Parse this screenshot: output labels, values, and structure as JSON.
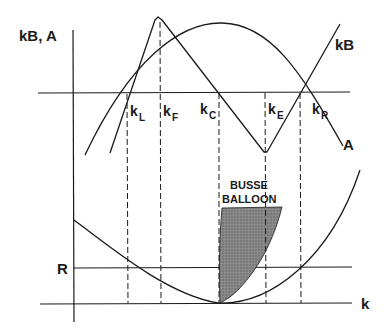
{
  "diagram": {
    "y_axis_label": "kB, A",
    "x_axis_label": "k",
    "r_label": "R",
    "curve_labels": {
      "kB": "kB",
      "A": "A"
    },
    "k_markers": [
      {
        "base": "k",
        "sub": "L"
      },
      {
        "base": "k",
        "sub": "F"
      },
      {
        "base": "k",
        "sub": "C"
      },
      {
        "base": "k",
        "sub": "E"
      },
      {
        "base": "k",
        "sub": "R"
      }
    ],
    "region_label_line1": "BUSSE",
    "region_label_line2": "BALLOON",
    "colors": {
      "line": "#1a1a1a",
      "shade": "#7a7a7a",
      "background": "#ffffff"
    }
  }
}
